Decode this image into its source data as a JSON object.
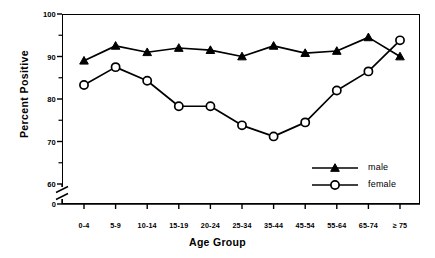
{
  "chart_data": {
    "type": "line",
    "title": "",
    "xlabel": "Age Group",
    "ylabel": "Percent  Positive",
    "categories": [
      "0-4",
      "5-9",
      "10-14",
      "15-19",
      "20-24",
      "25-34",
      "35-44",
      "45-54",
      "55-64",
      "65-74",
      "≥ 75"
    ],
    "series": [
      {
        "name": "male",
        "marker": "filled-triangle",
        "values": [
          89.0,
          92.5,
          91.0,
          92.0,
          91.5,
          90.0,
          92.5,
          90.8,
          91.3,
          94.5,
          90.0
        ]
      },
      {
        "name": "female",
        "marker": "open-circle",
        "values": [
          83.3,
          87.5,
          84.3,
          78.3,
          78.3,
          73.8,
          71.2,
          74.5,
          82.0,
          86.5,
          93.8
        ]
      }
    ],
    "yticks": [
      100,
      90,
      80,
      70,
      60,
      0
    ],
    "yminor": [
      95,
      85,
      75,
      65
    ],
    "ylim": [
      60,
      100
    ],
    "axis_break": true,
    "axis_break_label": "0",
    "grid": false,
    "legend_position": "inside-bottom-right",
    "line_color": "#000000"
  },
  "legend": {
    "items": [
      {
        "label": "male",
        "marker": "filled-triangle"
      },
      {
        "label": "female",
        "marker": "open-circle"
      }
    ]
  }
}
